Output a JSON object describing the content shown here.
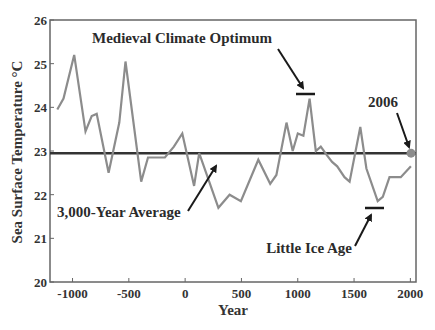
{
  "chart_data": {
    "type": "line",
    "title": "",
    "xlabel": "Year",
    "ylabel": "Sea Surface Temperature °C",
    "xlim": [
      -1200,
      2050
    ],
    "ylim": [
      20,
      26
    ],
    "grid": false,
    "legend": null,
    "xticks": [
      -1000,
      -500,
      0,
      500,
      1000,
      1500,
      2000
    ],
    "xtick_labels": [
      "-1000",
      "-500",
      "0",
      "500",
      "1000",
      "1500",
      "2000"
    ],
    "yticks": [
      20,
      21,
      22,
      23,
      24,
      25,
      26
    ],
    "ytick_labels": [
      "20",
      "21",
      "22",
      "23",
      "24",
      "25",
      "26"
    ],
    "series": [
      {
        "name": "Sea Surface Temperature",
        "color": "#8c8c8c",
        "x": [
          -1135,
          -1080,
          -985,
          -885,
          -830,
          -785,
          -680,
          -585,
          -530,
          -390,
          -330,
          -180,
          -100,
          -25,
          80,
          125,
          295,
          395,
          495,
          650,
          755,
          810,
          900,
          955,
          1000,
          1050,
          1105,
          1160,
          1205,
          1260,
          1305,
          1350,
          1415,
          1460,
          1555,
          1610,
          1710,
          1755,
          1815,
          1915,
          2005
        ],
        "y": [
          23.95,
          24.2,
          25.2,
          23.45,
          23.8,
          23.85,
          22.5,
          23.65,
          25.05,
          22.3,
          22.85,
          22.85,
          23.1,
          23.4,
          22.2,
          22.95,
          21.7,
          22.0,
          21.85,
          22.8,
          22.25,
          22.45,
          23.65,
          23.0,
          23.4,
          23.35,
          24.2,
          23.0,
          23.1,
          22.9,
          22.75,
          22.65,
          22.4,
          22.3,
          23.55,
          22.6,
          21.85,
          21.95,
          22.4,
          22.4,
          22.65
        ]
      },
      {
        "name": "3,000-Year Average",
        "color": "#333333",
        "x": [
          -1200,
          2050
        ],
        "y": [
          22.95,
          22.95
        ]
      }
    ],
    "markers": [
      {
        "name": "2006",
        "x": 2006,
        "y": 22.95,
        "color": "#8c8c8c"
      }
    ],
    "annotations": [
      {
        "text": "Medieval Climate Optimum",
        "target_bar": {
          "x": [
            1010,
            1180
          ],
          "y": 24.3
        }
      },
      {
        "text": "3,000-Year Average",
        "target": {
          "x": 315,
          "y": 23.0
        }
      },
      {
        "text": "Little Ice Age",
        "target_bar": {
          "x": 1640,
          "y": 21.7,
          "x_end": 1800
        }
      },
      {
        "text": "2006",
        "target": {
          "x": 2006,
          "y": 22.95
        }
      }
    ]
  },
  "labels": {
    "xlabel": "Year",
    "ylabel": "Sea Surface Temperature °C",
    "annot_mco": "Medieval Climate Optimum",
    "annot_avg": "3,000-Year Average",
    "annot_lia": "Little Ice Age",
    "annot_2006": "2006"
  }
}
